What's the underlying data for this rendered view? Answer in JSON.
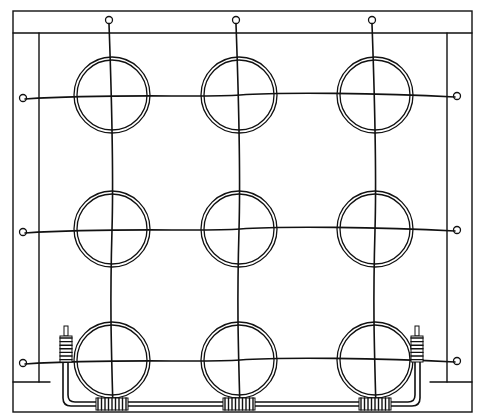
{
  "figure": {
    "kind": "line-art technical illustration",
    "grid": {
      "rows": 3,
      "cols": 3
    },
    "elements": {
      "rings": 9,
      "horizontal_wires": 3,
      "vertical_wires": 3,
      "wire_end_loops": 9,
      "bottom_coils": 3,
      "side_coils": 2
    },
    "colors": {
      "ink": "#111111",
      "background": "#ffffff"
    }
  }
}
